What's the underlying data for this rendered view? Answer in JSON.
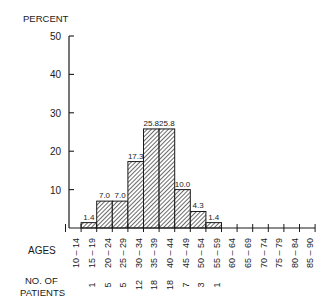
{
  "chart_data": {
    "type": "bar",
    "title": "",
    "ylabel": "PERCENT",
    "xlabel": "AGES",
    "ylim": [
      0,
      50
    ],
    "yticks": [
      10,
      20,
      30,
      40,
      50
    ],
    "grid": false,
    "legend": null,
    "categories": [
      "10-14",
      "15-19",
      "20-24",
      "25-29",
      "30-34",
      "35-39",
      "40-44",
      "45-49",
      "50-54",
      "55-59",
      "60-64",
      "65-69",
      "70-74",
      "75-79",
      "80-84",
      "85-90"
    ],
    "values": [
      0,
      1.4,
      7.0,
      7.0,
      17.3,
      25.8,
      25.8,
      10.0,
      4.3,
      1.4,
      0,
      0,
      0,
      0,
      0,
      0
    ],
    "value_labels": [
      "",
      "1.4",
      "7.0",
      "7.0",
      "17.3",
      "25.8",
      "25.8",
      "10.0",
      "4.3",
      "1.4",
      "",
      "",
      "",
      "",
      "",
      ""
    ],
    "patients_label": "NO. OF PATIENTS",
    "patients": [
      "",
      "1",
      "5",
      "5",
      "12",
      "18",
      "18",
      "7",
      "3",
      "1",
      "",
      "",
      "",
      "",
      "",
      ""
    ]
  },
  "labels": {
    "y_axis": "PERCENT",
    "ages": "AGES",
    "patients_line1": "NO. OF",
    "patients_line2": "PATIENTS"
  }
}
